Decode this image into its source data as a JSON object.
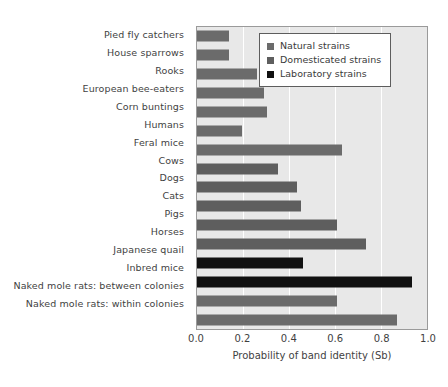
{
  "chart_data": {
    "type": "bar",
    "orientation": "horizontal",
    "title": "",
    "xlabel": "Probability of band identity (Sb)",
    "ylabel": "",
    "xlim": [
      0.0,
      1.0
    ],
    "xticks": [
      "0.0",
      "0.2",
      "0.4",
      "0.6",
      "0.8",
      "1.0"
    ],
    "xtick_values": [
      0.0,
      0.2,
      0.4,
      0.6,
      0.8,
      1.0
    ],
    "grid": true,
    "grid_axis": "x",
    "legend_position": "top-right",
    "categories": [
      "Pied fly catchers",
      "House sparrows",
      "Rooks",
      "European bee-eaters",
      "Corn buntings",
      "Humans",
      "Feral mice",
      "Cows",
      "Dogs",
      "Cats",
      "Pigs",
      "Horses",
      "Japanese quail",
      "Inbred mice",
      "Naked mole rats: between colonies",
      "Naked mole rats: within colonies"
    ],
    "values": [
      0.14,
      0.14,
      0.26,
      0.29,
      0.305,
      0.195,
      0.63,
      0.35,
      0.435,
      0.45,
      0.61,
      0.735,
      0.46,
      0.935,
      0.61,
      0.87
    ],
    "groups": [
      "natural",
      "natural",
      "natural",
      "natural",
      "natural",
      "natural",
      "natural",
      "domesticated",
      "domesticated",
      "domesticated",
      "domesticated",
      "domesticated",
      "laboratory",
      "laboratory",
      "natural",
      "natural"
    ],
    "series": [
      {
        "name": "Natural strains",
        "color": "#6b6b6b"
      },
      {
        "name": "Domesticated strains",
        "color": "#5e5e5e"
      },
      {
        "name": "Laboratory strains",
        "color": "#111111"
      }
    ],
    "bars": [
      {
        "label": "Pied fly catchers",
        "value": 0.14,
        "group": "natural"
      },
      {
        "label": "House sparrows",
        "value": 0.14,
        "group": "natural"
      },
      {
        "label": "Rooks",
        "value": 0.26,
        "group": "natural"
      },
      {
        "label": "European bee-eaters",
        "value": 0.29,
        "group": "natural"
      },
      {
        "label": "Corn buntings",
        "value": 0.305,
        "group": "natural"
      },
      {
        "label": "Humans",
        "value": 0.195,
        "group": "natural"
      },
      {
        "label": "Feral mice",
        "value": 0.63,
        "group": "natural"
      },
      {
        "label": "Cows",
        "value": 0.35,
        "group": "domesticated"
      },
      {
        "label": "Dogs",
        "value": 0.435,
        "group": "domesticated"
      },
      {
        "label": "Cats",
        "value": 0.45,
        "group": "domesticated"
      },
      {
        "label": "Pigs",
        "value": 0.61,
        "group": "domesticated"
      },
      {
        "label": "Horses",
        "value": 0.735,
        "group": "domesticated"
      },
      {
        "label": "Japanese quail",
        "value": 0.46,
        "group": "laboratory"
      },
      {
        "label": "Inbred mice",
        "value": 0.935,
        "group": "laboratory"
      },
      {
        "label": "Naked mole rats: between colonies",
        "value": 0.61,
        "group": "natural"
      },
      {
        "label": "Naked mole rats: within colonies",
        "value": 0.87,
        "group": "natural"
      }
    ]
  },
  "legend": {
    "items": [
      {
        "label": "Natural strains",
        "color": "#6b6b6b"
      },
      {
        "label": "Domesticated strains",
        "color": "#5e5e5e"
      },
      {
        "label": "Laboratory strains",
        "color": "#111111"
      }
    ]
  },
  "colors": {
    "plot_background": "#e8e8e8",
    "gridline": "#ffffff",
    "frame": "#9a9a9a",
    "text": "#3f3f3f",
    "natural": "#6b6b6b",
    "domesticated": "#5e5e5e",
    "laboratory": "#111111"
  }
}
